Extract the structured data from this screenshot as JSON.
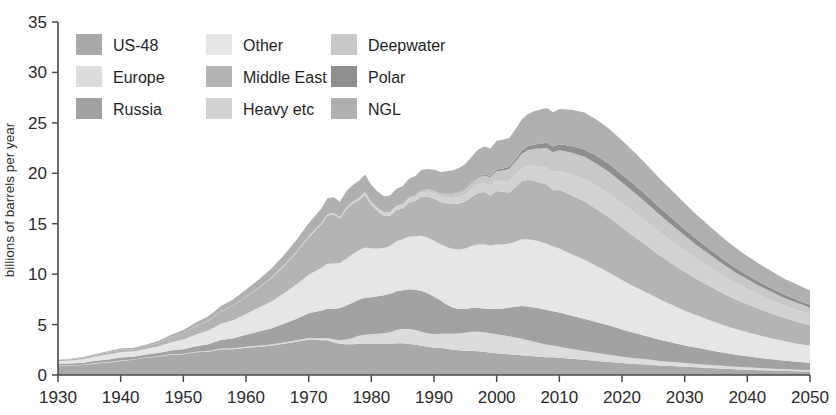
{
  "chart_data": {
    "type": "area",
    "stacked": true,
    "title": "",
    "subtitle": "",
    "xlabel": "",
    "ylabel": "billions of barrels per year",
    "xlim": [
      1930,
      2050
    ],
    "ylim": [
      0,
      35
    ],
    "xticks": [
      1930,
      1940,
      1950,
      1960,
      1970,
      1980,
      1990,
      2000,
      2010,
      2020,
      2030,
      2040,
      2050
    ],
    "yticks": [
      0,
      5,
      10,
      15,
      20,
      25,
      30,
      35
    ],
    "grid": false,
    "legend_position": "top-left-inside",
    "legend_columns": 3,
    "colors": {
      "US-48": "#a9a9a9",
      "Europe": "#dcdcdc",
      "Russia": "#a2a2a2",
      "Other": "#e6e6e6",
      "Middle East": "#b4b4b4",
      "Heavy etc": "#d2d2d2",
      "Deepwater": "#c8c8c8",
      "Polar": "#8e8e8e",
      "NGL": "#b0b0b0",
      "axis": "#4a4a4a",
      "text": "#2b2b2b",
      "background": "#ffffff"
    },
    "x": [
      1930,
      1932,
      1934,
      1936,
      1938,
      1940,
      1942,
      1944,
      1946,
      1948,
      1950,
      1952,
      1954,
      1956,
      1958,
      1960,
      1962,
      1964,
      1966,
      1968,
      1970,
      1972,
      1973,
      1974,
      1975,
      1976,
      1977,
      1978,
      1979,
      1980,
      1981,
      1982,
      1983,
      1984,
      1985,
      1986,
      1987,
      1988,
      1989,
      1990,
      1991,
      1992,
      1993,
      1994,
      1995,
      1996,
      1997,
      1998,
      1999,
      2000,
      2001,
      2002,
      2003,
      2004,
      2005,
      2006,
      2007,
      2008,
      2009,
      2010,
      2012,
      2014,
      2016,
      2018,
      2020,
      2022,
      2024,
      2026,
      2028,
      2030,
      2032,
      2034,
      2036,
      2038,
      2040,
      2042,
      2044,
      2046,
      2048,
      2050
    ],
    "series": [
      {
        "name": "US-48",
        "values": [
          0.95,
          0.95,
          1.0,
          1.15,
          1.25,
          1.4,
          1.5,
          1.7,
          1.8,
          2.0,
          2.05,
          2.25,
          2.3,
          2.55,
          2.55,
          2.7,
          2.8,
          2.9,
          3.1,
          3.3,
          3.5,
          3.45,
          3.45,
          3.25,
          3.1,
          3.05,
          3.05,
          3.1,
          3.1,
          3.1,
          3.1,
          3.1,
          3.1,
          3.15,
          3.15,
          3.1,
          3.0,
          2.9,
          2.8,
          2.7,
          2.7,
          2.6,
          2.5,
          2.45,
          2.4,
          2.4,
          2.35,
          2.3,
          2.2,
          2.15,
          2.1,
          2.05,
          2.0,
          1.95,
          1.9,
          1.85,
          1.8,
          1.75,
          1.75,
          1.7,
          1.6,
          1.5,
          1.4,
          1.3,
          1.2,
          1.1,
          1.05,
          0.95,
          0.9,
          0.82,
          0.76,
          0.7,
          0.64,
          0.58,
          0.53,
          0.48,
          0.44,
          0.4,
          0.37,
          0.34
        ]
      },
      {
        "name": "Europe",
        "values": [
          0.02,
          0.02,
          0.02,
          0.03,
          0.03,
          0.04,
          0.04,
          0.04,
          0.05,
          0.05,
          0.06,
          0.06,
          0.07,
          0.08,
          0.09,
          0.1,
          0.11,
          0.12,
          0.13,
          0.15,
          0.18,
          0.2,
          0.22,
          0.26,
          0.35,
          0.48,
          0.62,
          0.78,
          0.9,
          0.95,
          1.0,
          1.05,
          1.15,
          1.3,
          1.4,
          1.45,
          1.45,
          1.4,
          1.35,
          1.35,
          1.4,
          1.5,
          1.6,
          1.7,
          1.8,
          1.9,
          1.95,
          1.95,
          1.95,
          1.9,
          1.85,
          1.8,
          1.72,
          1.65,
          1.55,
          1.45,
          1.35,
          1.25,
          1.18,
          1.1,
          0.98,
          0.88,
          0.78,
          0.7,
          0.62,
          0.56,
          0.5,
          0.45,
          0.4,
          0.36,
          0.33,
          0.3,
          0.27,
          0.25,
          0.23,
          0.21,
          0.19,
          0.17,
          0.16,
          0.15
        ]
      },
      {
        "name": "Russia",
        "values": [
          0.15,
          0.17,
          0.2,
          0.23,
          0.26,
          0.3,
          0.28,
          0.3,
          0.32,
          0.38,
          0.45,
          0.55,
          0.68,
          0.85,
          1.0,
          1.2,
          1.4,
          1.6,
          1.85,
          2.1,
          2.45,
          2.75,
          2.9,
          3.05,
          3.2,
          3.35,
          3.5,
          3.6,
          3.65,
          3.65,
          3.7,
          3.75,
          3.8,
          3.85,
          3.85,
          3.95,
          4.0,
          4.05,
          3.95,
          3.7,
          3.3,
          2.9,
          2.6,
          2.4,
          2.35,
          2.35,
          2.35,
          2.35,
          2.4,
          2.5,
          2.65,
          2.85,
          3.05,
          3.25,
          3.35,
          3.4,
          3.45,
          3.45,
          3.4,
          3.4,
          3.3,
          3.2,
          3.05,
          2.9,
          2.7,
          2.5,
          2.3,
          2.1,
          1.92,
          1.75,
          1.6,
          1.45,
          1.32,
          1.2,
          1.1,
          1.0,
          0.92,
          0.85,
          0.78,
          0.72
        ]
      },
      {
        "name": "Other",
        "values": [
          0.25,
          0.3,
          0.35,
          0.42,
          0.5,
          0.55,
          0.5,
          0.55,
          0.65,
          0.8,
          0.95,
          1.15,
          1.35,
          1.6,
          1.8,
          2.05,
          2.35,
          2.65,
          3.0,
          3.4,
          3.8,
          4.2,
          4.45,
          4.5,
          4.45,
          4.65,
          4.8,
          4.9,
          5.0,
          4.85,
          4.75,
          4.7,
          4.75,
          4.95,
          5.05,
          5.2,
          5.3,
          5.45,
          5.5,
          5.55,
          5.6,
          5.7,
          5.8,
          5.9,
          6.0,
          6.15,
          6.3,
          6.35,
          6.3,
          6.4,
          6.35,
          6.35,
          6.45,
          6.6,
          6.65,
          6.65,
          6.6,
          6.55,
          6.4,
          6.35,
          6.1,
          5.85,
          5.55,
          5.25,
          4.9,
          4.6,
          4.3,
          4.0,
          3.72,
          3.45,
          3.2,
          2.98,
          2.76,
          2.56,
          2.38,
          2.22,
          2.07,
          1.93,
          1.8,
          1.7
        ]
      },
      {
        "name": "Middle East",
        "values": [
          0.1,
          0.12,
          0.15,
          0.18,
          0.22,
          0.25,
          0.22,
          0.25,
          0.35,
          0.5,
          0.65,
          0.85,
          1.0,
          1.25,
          1.45,
          1.7,
          1.95,
          2.3,
          2.7,
          3.15,
          3.7,
          4.3,
          4.8,
          4.85,
          4.4,
          4.9,
          5.0,
          4.95,
          5.2,
          4.3,
          3.7,
          3.2,
          3.0,
          3.1,
          3.05,
          3.4,
          3.5,
          3.9,
          4.1,
          4.2,
          4.15,
          4.35,
          4.45,
          4.55,
          4.65,
          4.85,
          5.1,
          5.2,
          4.95,
          5.3,
          5.2,
          5.05,
          5.4,
          5.75,
          5.9,
          5.9,
          5.85,
          5.9,
          5.6,
          5.8,
          5.85,
          5.8,
          5.65,
          5.45,
          5.2,
          4.95,
          4.65,
          4.35,
          4.1,
          3.85,
          3.6,
          3.38,
          3.15,
          2.95,
          2.78,
          2.6,
          2.45,
          2.3,
          2.18,
          2.05
        ]
      },
      {
        "name": "Heavy etc",
        "values": [
          0.0,
          0.0,
          0.0,
          0.0,
          0.0,
          0.0,
          0.0,
          0.0,
          0.0,
          0.0,
          0.01,
          0.01,
          0.02,
          0.02,
          0.03,
          0.04,
          0.05,
          0.06,
          0.08,
          0.1,
          0.12,
          0.14,
          0.15,
          0.16,
          0.17,
          0.18,
          0.2,
          0.22,
          0.24,
          0.25,
          0.26,
          0.28,
          0.3,
          0.33,
          0.35,
          0.38,
          0.4,
          0.43,
          0.46,
          0.5,
          0.54,
          0.58,
          0.62,
          0.66,
          0.7,
          0.76,
          0.82,
          0.88,
          0.94,
          1.0,
          1.06,
          1.14,
          1.22,
          1.3,
          1.4,
          1.5,
          1.6,
          1.7,
          1.78,
          1.88,
          2.05,
          2.2,
          2.3,
          2.35,
          2.38,
          2.38,
          2.35,
          2.3,
          2.22,
          2.12,
          2.0,
          1.88,
          1.75,
          1.62,
          1.5,
          1.4,
          1.3,
          1.2,
          1.12,
          1.05
        ]
      },
      {
        "name": "Deepwater",
        "values": [
          0.0,
          0.0,
          0.0,
          0.0,
          0.0,
          0.0,
          0.0,
          0.0,
          0.0,
          0.0,
          0.0,
          0.0,
          0.0,
          0.0,
          0.0,
          0.0,
          0.0,
          0.0,
          0.0,
          0.0,
          0.0,
          0.0,
          0.0,
          0.0,
          0.0,
          0.0,
          0.0,
          0.01,
          0.02,
          0.03,
          0.04,
          0.05,
          0.07,
          0.09,
          0.11,
          0.13,
          0.16,
          0.19,
          0.22,
          0.26,
          0.3,
          0.35,
          0.4,
          0.46,
          0.52,
          0.6,
          0.68,
          0.76,
          0.86,
          0.96,
          1.06,
          1.18,
          1.3,
          1.42,
          1.55,
          1.68,
          1.8,
          1.9,
          1.98,
          2.05,
          2.15,
          2.2,
          2.2,
          2.15,
          2.08,
          1.98,
          1.86,
          1.74,
          1.6,
          1.48,
          1.36,
          1.25,
          1.15,
          1.05,
          0.97,
          0.9,
          0.83,
          0.77,
          0.72,
          0.67
        ]
      },
      {
        "name": "Polar",
        "values": [
          0.0,
          0.0,
          0.0,
          0.0,
          0.0,
          0.0,
          0.0,
          0.0,
          0.0,
          0.0,
          0.0,
          0.0,
          0.0,
          0.0,
          0.0,
          0.0,
          0.0,
          0.0,
          0.0,
          0.0,
          0.0,
          0.0,
          0.0,
          0.0,
          0.0,
          0.0,
          0.0,
          0.0,
          0.0,
          0.0,
          0.0,
          0.0,
          0.0,
          0.0,
          0.0,
          0.0,
          0.0,
          0.0,
          0.0,
          0.01,
          0.02,
          0.03,
          0.04,
          0.05,
          0.06,
          0.08,
          0.1,
          0.12,
          0.14,
          0.17,
          0.2,
          0.24,
          0.28,
          0.32,
          0.37,
          0.42,
          0.47,
          0.52,
          0.56,
          0.6,
          0.68,
          0.74,
          0.78,
          0.8,
          0.8,
          0.79,
          0.76,
          0.72,
          0.68,
          0.63,
          0.58,
          0.54,
          0.5,
          0.46,
          0.42,
          0.39,
          0.36,
          0.33,
          0.31,
          0.29
        ]
      },
      {
        "name": "NGL",
        "values": [
          0.05,
          0.06,
          0.07,
          0.08,
          0.1,
          0.12,
          0.14,
          0.16,
          0.2,
          0.24,
          0.28,
          0.34,
          0.4,
          0.5,
          0.58,
          0.68,
          0.78,
          0.9,
          1.0,
          1.15,
          1.3,
          1.45,
          1.55,
          1.55,
          1.5,
          1.6,
          1.65,
          1.7,
          1.78,
          1.7,
          1.65,
          1.6,
          1.62,
          1.7,
          1.75,
          1.85,
          1.92,
          2.0,
          2.05,
          2.1,
          2.12,
          2.2,
          2.28,
          2.35,
          2.45,
          2.55,
          2.68,
          2.75,
          2.72,
          2.85,
          2.85,
          2.85,
          2.95,
          3.1,
          3.2,
          3.3,
          3.4,
          3.45,
          3.4,
          3.5,
          3.6,
          3.65,
          3.6,
          3.5,
          3.38,
          3.22,
          3.05,
          2.88,
          2.72,
          2.56,
          2.4,
          2.26,
          2.12,
          2.0,
          1.88,
          1.78,
          1.68,
          1.58,
          1.5,
          1.42
        ]
      }
    ]
  },
  "legend": {
    "columns": [
      {
        "items": [
          {
            "label": "US-48",
            "color": "#a9a9a9"
          },
          {
            "label": "Europe",
            "color": "#dcdcdc"
          },
          {
            "label": "Russia",
            "color": "#a2a2a2"
          }
        ]
      },
      {
        "items": [
          {
            "label": "Other",
            "color": "#e6e6e6"
          },
          {
            "label": "Middle East",
            "color": "#b4b4b4"
          },
          {
            "label": "Heavy etc",
            "color": "#d2d2d2"
          }
        ]
      },
      {
        "items": [
          {
            "label": "Deepwater",
            "color": "#c8c8c8"
          },
          {
            "label": "Polar",
            "color": "#8e8e8e"
          },
          {
            "label": "NGL",
            "color": "#b0b0b0"
          }
        ]
      }
    ]
  },
  "axes": {
    "y_axis_label": "billions of barrels per year",
    "y_tick_labels": [
      "0",
      "5",
      "10",
      "15",
      "20",
      "25",
      "30",
      "35"
    ],
    "x_tick_labels": [
      "1930",
      "1940",
      "1950",
      "1960",
      "1970",
      "1980",
      "1990",
      "2000",
      "2010",
      "2020",
      "2030",
      "2040",
      "2050"
    ]
  }
}
